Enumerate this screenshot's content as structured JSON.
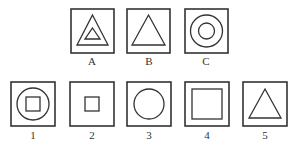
{
  "question_figures": [
    {
      "label": "A",
      "shape": "nested-triangles-in-square"
    },
    {
      "label": "B",
      "shape": "triangle-in-square"
    },
    {
      "label": "C",
      "shape": "concentric-circles-in-square"
    }
  ],
  "answer_options": [
    {
      "label": "1",
      "shape": "square-in-circle-in-square"
    },
    {
      "label": "2",
      "shape": "small-square-in-square"
    },
    {
      "label": "3",
      "shape": "circle-in-square"
    },
    {
      "label": "4",
      "shape": "large-square-in-square"
    },
    {
      "label": "5",
      "shape": "triangle-in-square"
    }
  ]
}
